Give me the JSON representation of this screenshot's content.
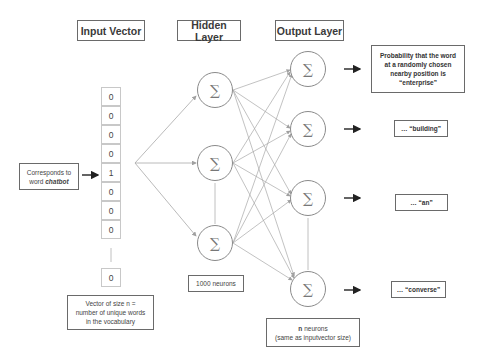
{
  "headers": {
    "input": "Input Vector",
    "hidden": "Hidden Layer",
    "output": "Output Layer"
  },
  "input_vector": {
    "cells": [
      "0",
      "0",
      "0",
      "0",
      "1",
      "0",
      "0",
      "0"
    ],
    "last_cell": "0",
    "caption_lines": [
      "Vector of size n =",
      "number of unique words",
      "in the vocabulary"
    ]
  },
  "input_note": {
    "line1": "Corresponds to",
    "line2_prefix": "word ",
    "line2_word": "chatbot"
  },
  "hidden_layer": {
    "node_symbol": "∑",
    "caption": "1000 neurons"
  },
  "output_layer": {
    "node_symbol": "∑",
    "caption_line1": "n neurons",
    "caption_line2": "(same as inputvector size)",
    "labels": [
      [
        "Probability that the word",
        "at a randomly chosen",
        "nearby position is",
        "“enterprise”"
      ],
      [
        "… “building”"
      ],
      [
        "… “an”"
      ],
      [
        "… “converse”"
      ]
    ]
  },
  "colors": {
    "edge": "#a8a8a8",
    "node_border": "#8a8a8a",
    "box_border": "#6a6a6a",
    "arrow": "#222222"
  }
}
